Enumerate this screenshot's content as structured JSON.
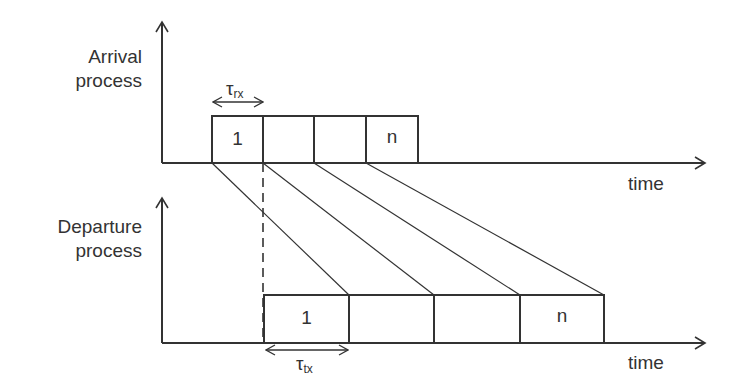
{
  "diagram": {
    "arrival": {
      "label_line1": "Arrival",
      "label_line2": "process",
      "tau_symbol": "τ",
      "tau_sub": "rx",
      "axis_label": "time",
      "boxes": [
        {
          "label": "1"
        },
        {
          "label": ""
        },
        {
          "label": ""
        },
        {
          "label": "n"
        }
      ]
    },
    "departure": {
      "label_line1": "Departure",
      "label_line2": "process",
      "tau_symbol": "τ",
      "tau_sub": "tx",
      "axis_label": "time",
      "boxes": [
        {
          "label": "1"
        },
        {
          "label": ""
        },
        {
          "label": ""
        },
        {
          "label": "n"
        }
      ]
    },
    "colors": {
      "line": "#333333",
      "text": "#333333",
      "background": "#ffffff"
    }
  }
}
